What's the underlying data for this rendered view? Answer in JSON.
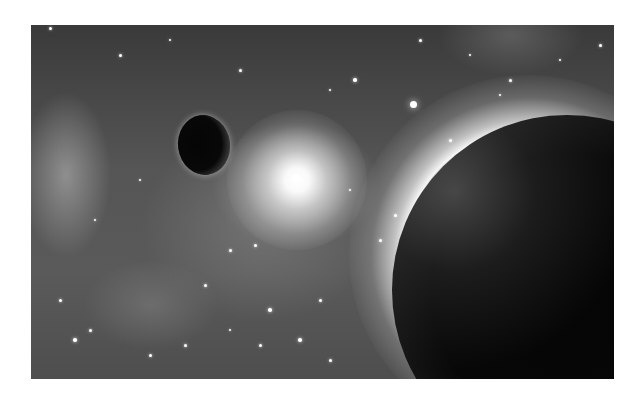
{
  "scene": {
    "description": "Grayscale space scene: nebula and star field, bright star, small dark moon, large dark planet with glowing rim",
    "palette": {
      "background": "#ffffff",
      "space_dark": "#3a3a3a",
      "space_mid": "#5a5a5a",
      "glow": "#ffffff",
      "planet": "#050505"
    },
    "frame": {
      "x": 31,
      "y": 25,
      "width": 583,
      "height": 354
    },
    "bodies": {
      "bright_star": {
        "cx": 297,
        "cy": 180
      },
      "small_moon": {
        "cx": 205,
        "cy": 145,
        "rx": 26,
        "ry": 30
      },
      "large_planet": {
        "left_edge_x": 392,
        "top_edge_y": 115
      }
    },
    "stars": [
      [
        413,
        104,
        3.5
      ],
      [
        296,
        178,
        4
      ],
      [
        50,
        28,
        1.5
      ],
      [
        120,
        55,
        1.5
      ],
      [
        170,
        40,
        1.2
      ],
      [
        240,
        70,
        1.5
      ],
      [
        330,
        90,
        1.2
      ],
      [
        355,
        80,
        1.8
      ],
      [
        420,
        40,
        1.5
      ],
      [
        470,
        55,
        1.2
      ],
      [
        510,
        80,
        1.5
      ],
      [
        560,
        60,
        1.2
      ],
      [
        600,
        45,
        1.5
      ],
      [
        450,
        140,
        1.5
      ],
      [
        500,
        95,
        1.2
      ],
      [
        230,
        250,
        1.5
      ],
      [
        270,
        310,
        1.8
      ],
      [
        260,
        345,
        1.5
      ],
      [
        320,
        300,
        1.5
      ],
      [
        300,
        340,
        1.8
      ],
      [
        205,
        285,
        1.5
      ],
      [
        185,
        345,
        1.5
      ],
      [
        90,
        330,
        1.5
      ],
      [
        75,
        340,
        1.8
      ],
      [
        150,
        355,
        1.5
      ],
      [
        380,
        240,
        1.5
      ],
      [
        230,
        330,
        1.2
      ],
      [
        350,
        190,
        1.2
      ],
      [
        140,
        180,
        1.2
      ],
      [
        95,
        220,
        1.2
      ],
      [
        60,
        300,
        1.5
      ],
      [
        330,
        360,
        1.5
      ],
      [
        255,
        245,
        1.5
      ],
      [
        395,
        215,
        1.5
      ]
    ]
  }
}
